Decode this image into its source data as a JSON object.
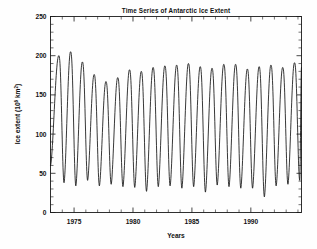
{
  "chart_data": {
    "type": "line",
    "title": "Time Series of Antarctic Ice Extent",
    "xlabel": "Years",
    "ylabel": "Ice extent (10⁶ km²)",
    "ylabel_parts": {
      "prefix": "Ice extent (10",
      "exponent": "6",
      "suffix": " km",
      "unit_exponent": "2",
      "close": ")"
    },
    "xlim": [
      1973.0,
      1994.3
    ],
    "ylim": [
      0,
      250
    ],
    "x_ticks": [
      1975,
      1980,
      1985,
      1990
    ],
    "x_tick_labels": [
      "1975",
      "1980",
      "1985",
      "1990"
    ],
    "x_minor_interval": 1,
    "y_ticks": [
      0,
      50,
      100,
      150,
      200,
      250
    ],
    "y_tick_labels": [
      "0",
      "50",
      "100",
      "150",
      "200",
      "250"
    ],
    "y_minor_interval": 10,
    "grid": false,
    "legend": null,
    "line_color": "#141414",
    "series": [
      {
        "name": "Antarctic sea ice extent",
        "annual_peaks": {
          "x": [
            1973.7,
            1974.7,
            1975.7,
            1976.7,
            1977.7,
            1978.7,
            1979.7,
            1980.7,
            1981.7,
            1982.7,
            1983.7,
            1984.7,
            1985.7,
            1986.7,
            1987.7,
            1988.7,
            1989.7,
            1990.7,
            1991.7,
            1992.7,
            1993.7
          ],
          "y": [
            200,
            205,
            192,
            176,
            167,
            172,
            182,
            180,
            185,
            187,
            188,
            190,
            186,
            184,
            189,
            189,
            183,
            186,
            188,
            185,
            191
          ]
        },
        "annual_troughs": {
          "x": [
            1974.15,
            1975.15,
            1976.15,
            1977.15,
            1978.15,
            1979.15,
            1980.15,
            1981.15,
            1982.15,
            1983.15,
            1984.15,
            1985.15,
            1986.15,
            1987.15,
            1988.15,
            1989.15,
            1990.15,
            1991.15,
            1992.15,
            1993.15,
            1994.15
          ],
          "y": [
            38,
            34,
            41,
            34,
            36,
            33,
            32,
            27,
            33,
            34,
            31,
            33,
            26,
            35,
            33,
            31,
            31,
            20,
            34,
            36,
            41
          ]
        },
        "start_value": 60,
        "end_value": 185,
        "mean_annual_cycle_note": "sinusoid-like annual cycle, minimum in Feb, maximum in Sep"
      }
    ]
  },
  "axis": {
    "y_label_text": "Ice extent (10⁶ km²)",
    "x_label_text": "Years"
  }
}
